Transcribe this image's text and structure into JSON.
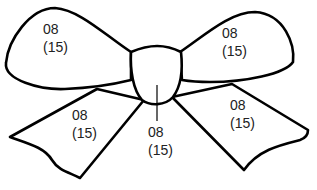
{
  "figure": {
    "clipped_caption": "",
    "stroke_color": "#000000",
    "fill_color": "#ffffff",
    "text_color": "#222222"
  },
  "parts": {
    "left_loop": {
      "code": "08",
      "qty": "(15)"
    },
    "right_loop": {
      "code": "08",
      "qty": "(15)"
    },
    "left_tail": {
      "code": "08",
      "qty": "(15)"
    },
    "right_tail": {
      "code": "08",
      "qty": "(15)"
    },
    "knot": {
      "code": "08",
      "qty": "(15)"
    }
  }
}
